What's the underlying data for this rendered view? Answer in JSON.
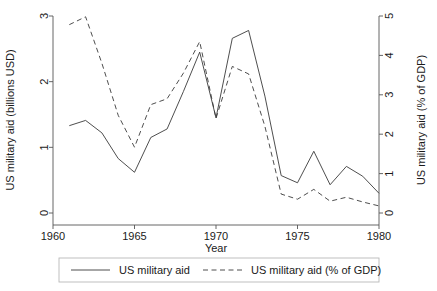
{
  "chart_data": {
    "type": "line",
    "title": "",
    "xlabel": "Year",
    "ylabel": "US military aid (billions USD)",
    "y2label": "US military aid (% of GDP)",
    "grid": false,
    "legend_position": "bottom",
    "xlim": [
      1960,
      1980
    ],
    "ylim": [
      0,
      3
    ],
    "y2lim": [
      0,
      5
    ],
    "xticks": [
      "1960",
      "1965",
      "1970",
      "1975",
      "1980"
    ],
    "xtick_values": [
      1960,
      1965,
      1970,
      1975,
      1980
    ],
    "yticks": [
      "0",
      "1",
      "2",
      "3"
    ],
    "ytick_values": [
      0,
      1,
      2,
      3
    ],
    "y2ticks": [
      "0",
      "1",
      "2",
      "3",
      "4",
      "5"
    ],
    "y2tick_values": [
      0,
      1,
      2,
      3,
      4,
      5
    ],
    "x": [
      1961,
      1962,
      1963,
      1964,
      1965,
      1966,
      1967,
      1968,
      1969,
      1970,
      1971,
      1972,
      1973,
      1974,
      1975,
      1976,
      1977,
      1978,
      1979,
      1980
    ],
    "series": [
      {
        "name": "US military aid",
        "axis": "left",
        "style": "solid",
        "unit": "billions USD",
        "values": [
          1.33,
          1.41,
          1.22,
          0.83,
          0.62,
          1.15,
          1.28,
          1.85,
          2.45,
          1.45,
          2.66,
          2.78,
          1.78,
          0.57,
          0.46,
          0.94,
          0.43,
          0.71,
          0.56,
          0.3
        ]
      },
      {
        "name": "US military aid (% of GDP)",
        "axis": "right",
        "style": "dashed",
        "unit": "% of GDP",
        "values": [
          4.78,
          4.98,
          3.8,
          2.48,
          1.67,
          2.75,
          2.9,
          3.55,
          4.35,
          2.4,
          3.72,
          3.53,
          2.2,
          0.48,
          0.35,
          0.6,
          0.3,
          0.4,
          0.28,
          0.18
        ]
      }
    ]
  },
  "legend": {
    "entries": [
      {
        "label": "US military aid",
        "style": "solid"
      },
      {
        "label": "US military aid (% of GDP)",
        "style": "dashed"
      }
    ]
  }
}
